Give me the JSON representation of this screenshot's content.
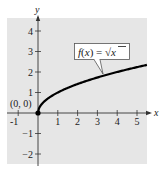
{
  "chart_data": {
    "type": "line",
    "title": "",
    "xlabel": "x",
    "ylabel": "y",
    "xlim": [
      -1.5,
      5.6
    ],
    "ylim": [
      -2.5,
      4.6
    ],
    "grid": false,
    "background": "#e6e6e6",
    "x_ticks": [
      -1,
      1,
      2,
      3,
      4,
      5
    ],
    "y_ticks": [
      4,
      3,
      2,
      1,
      -1,
      -2
    ],
    "x_tick_labels": [
      "-1",
      "1",
      "2",
      "3",
      "4",
      "5"
    ],
    "y_tick_labels": [
      "4",
      "3",
      "2",
      "1",
      "−1",
      "−2"
    ],
    "series": [
      {
        "name": "f(x) = √x",
        "function": "sqrt(x)",
        "domain": [
          0,
          5.5
        ],
        "color": "#000000",
        "x": [
          0,
          0.25,
          0.5,
          1,
          1.5,
          2,
          2.5,
          3,
          3.5,
          4,
          4.5,
          5,
          5.5
        ],
        "values": [
          0,
          0.5,
          0.71,
          1,
          1.22,
          1.41,
          1.58,
          1.73,
          1.87,
          2,
          2.12,
          2.24,
          2.35
        ]
      }
    ],
    "annotations": [
      {
        "text": "(0, 0)",
        "x": 0,
        "y": 0,
        "type": "point-label"
      },
      {
        "text": "f(x) = √x",
        "type": "callout",
        "points_to": [
          3.3,
          1.82
        ]
      }
    ]
  },
  "labels": {
    "x_axis": "x",
    "y_axis": "y",
    "origin": "(0, 0)",
    "fn_prefix": "f(x) = ",
    "fn_sqrt": "√",
    "fn_arg": "x"
  }
}
